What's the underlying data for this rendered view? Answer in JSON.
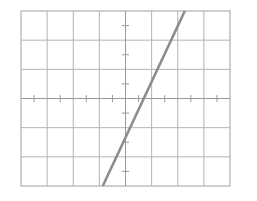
{
  "figure": {
    "name": "coordinate-grid-line-graph",
    "background_color": "#ffffff",
    "width": 257,
    "height": 201
  },
  "style": {
    "grid_color": "#b3b3b3",
    "frame_color": "#b0b0b0",
    "axis_color": "#9a9a9a",
    "tick_color": "#9a9a9a",
    "line_color": "#8c8c8c",
    "grid_width": 1,
    "frame_width": 1.2,
    "axis_width": 1,
    "tick_width": 1,
    "line_width": 2.6
  },
  "plot_box": {
    "left": 21,
    "top": 11,
    "right": 230,
    "bottom": 186,
    "columns": 8,
    "rows": 6,
    "cell_width": 26.125,
    "cell_height": 29.1667
  },
  "chart_data": {
    "type": "line",
    "title": "",
    "subtitle": "",
    "xlabel": "",
    "ylabel": "",
    "grid": true,
    "grid_spacing_x": 1,
    "grid_spacing_y": 1,
    "legend": false,
    "legend_position": "none",
    "axes_shown": [
      "x-axis",
      "y-axis"
    ],
    "origin": {
      "x": 0,
      "y": 0
    },
    "origin_pixel": {
      "x": 125.8,
      "y": 98.5
    },
    "xlim": [
      -4,
      4
    ],
    "ylim": [
      -3,
      3
    ],
    "xticks": [
      -3.5,
      -2.5,
      -1.5,
      -0.5,
      0.5,
      1.5,
      2.5,
      3.5
    ],
    "yticks": [
      -2.5,
      -1.5,
      -0.5,
      0.5,
      1.5,
      2.5
    ],
    "xticklabels": [],
    "yticklabels": [],
    "tick_style": "midpoint-of-cell",
    "tick_length": 7,
    "annotations": [],
    "series": [
      {
        "name": "line",
        "type": "line",
        "color": "#8c8c8c",
        "slope": 2.13,
        "intercept": -0.29,
        "equation": "y = 2.13x - 0.29",
        "x": [
          -0.87,
          2.27
        ],
        "y": [
          -3.0,
          3.0
        ],
        "endpoints_pixel": [
          {
            "x": 103.0,
            "y": 186.0
          },
          {
            "x": 185.0,
            "y": 11.0
          }
        ],
        "clipped_to_frame": true
      }
    ]
  }
}
